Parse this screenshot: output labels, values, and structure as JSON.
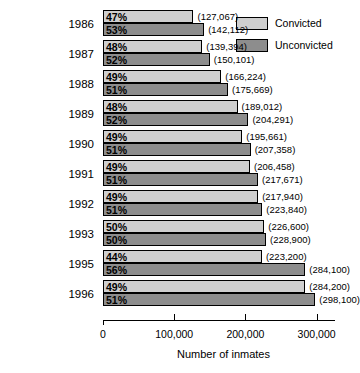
{
  "chart_data": {
    "type": "bar",
    "orientation": "horizontal",
    "title": "",
    "xlabel": "Number of inmates",
    "ylabel": "",
    "xlim": [
      0,
      330000
    ],
    "xticks": [
      0,
      100000,
      200000,
      300000
    ],
    "xticklabels": [
      "0",
      "100,000",
      "200,000",
      "300,000"
    ],
    "grid": false,
    "legend_position": "top-right",
    "categories": [
      "1986",
      "1987",
      "1988",
      "1989",
      "1990",
      "1991",
      "1992",
      "1993",
      "1995",
      "1996"
    ],
    "series": [
      {
        "name": "Convicted",
        "color": "#cfcfcf",
        "values": [
          127067,
          139394,
          166224,
          189012,
          195661,
          206458,
          217940,
          226600,
          223200,
          284200
        ],
        "value_labels": [
          "(127,067)",
          "(139,394)",
          "(166,224)",
          "(189,012)",
          "(195,661)",
          "(206,458)",
          "(217,940)",
          "(226,600)",
          "(223,200)",
          "(284,200)"
        ],
        "percent_labels": [
          "47%",
          "48%",
          "49%",
          "48%",
          "49%",
          "49%",
          "49%",
          "50%",
          "44%",
          "49%"
        ]
      },
      {
        "name": "Unconvicted",
        "color": "#8d8d8d",
        "values": [
          142112,
          150101,
          175669,
          204291,
          207358,
          217671,
          223840,
          228900,
          284100,
          298100
        ],
        "value_labels": [
          "(142,112)",
          "(150,101)",
          "(175,669)",
          "(204,291)",
          "(207,358)",
          "(217,671)",
          "(223,840)",
          "(228,900)",
          "(284,100)",
          "(298,100)"
        ],
        "percent_labels": [
          "53%",
          "52%",
          "51%",
          "52%",
          "51%",
          "51%",
          "51%",
          "50%",
          "56%",
          "51%"
        ]
      }
    ]
  },
  "legend": {
    "items": [
      {
        "label": "Convicted",
        "swatch": "convicted-swatch"
      },
      {
        "label": "Unconvicted",
        "swatch": "unconvicted-swatch"
      }
    ]
  },
  "axis": {
    "title": "Number of inmates",
    "ticklabels": [
      "0",
      "100,000",
      "200,000",
      "300,000"
    ]
  }
}
